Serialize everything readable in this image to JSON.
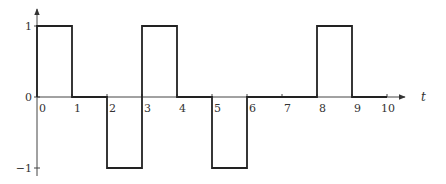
{
  "chart_data": {
    "type": "line",
    "title": "",
    "xlabel": "t",
    "ylabel": "",
    "style": "step (rectangular pulse waveform)",
    "xlim": [
      0,
      10
    ],
    "ylim": [
      -1,
      1
    ],
    "grid": false,
    "legend": null,
    "x_ticks": [
      "0",
      "1",
      "2",
      "3",
      "4",
      "5",
      "6",
      "7",
      "8",
      "9",
      "10"
    ],
    "y_ticks": [
      "1",
      "0",
      "−1"
    ],
    "segments": [
      {
        "t_start": 0,
        "t_end": 1,
        "value": 1
      },
      {
        "t_start": 1,
        "t_end": 2,
        "value": 0
      },
      {
        "t_start": 2,
        "t_end": 3,
        "value": -1
      },
      {
        "t_start": 3,
        "t_end": 4,
        "value": 1
      },
      {
        "t_start": 4,
        "t_end": 5,
        "value": 0
      },
      {
        "t_start": 5,
        "t_end": 6,
        "value": -1
      },
      {
        "t_start": 6,
        "t_end": 8,
        "value": 0
      },
      {
        "t_start": 8,
        "t_end": 9,
        "value": 1
      },
      {
        "t_start": 9,
        "t_end": 10,
        "value": 0
      }
    ],
    "x": [
      0,
      1,
      1,
      2,
      2,
      3,
      3,
      4,
      4,
      5,
      5,
      6,
      6,
      8,
      8,
      9,
      9,
      10
    ],
    "y": [
      1,
      1,
      0,
      0,
      -1,
      -1,
      1,
      1,
      0,
      0,
      -1,
      -1,
      0,
      0,
      1,
      1,
      0,
      0
    ]
  },
  "axes": {
    "x_label": "t",
    "y_tick_labels": {
      "top": "1",
      "zero": "0",
      "bottom": "−1"
    }
  }
}
